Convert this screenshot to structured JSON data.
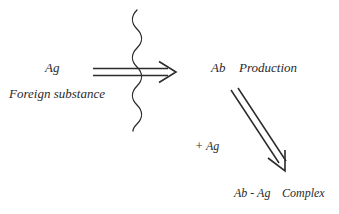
{
  "figure": {
    "type": "biology-process-diagram",
    "background_color": "#ffffff",
    "ink_color": "#2b2b2b",
    "width": 339,
    "height": 214
  },
  "labels": {
    "antigen": "Ag",
    "antigen_caption": "Foreign substance",
    "antibody": "Ab",
    "antibody_action": "Production",
    "plus_antigen": "+ Ag",
    "complex_pair": "Ab - Ag",
    "complex_word": "Complex"
  },
  "graphics": {
    "horizontal_arrow": {
      "name": "double-line-arrow-right",
      "x_start": 93,
      "x_end": 175,
      "y_top_line": 68,
      "y_bottom_line": 75,
      "arrowhead": "open-v"
    },
    "wavy_barrier": {
      "name": "vertical-wavy-line",
      "x_center": 137,
      "y_start": 10,
      "y_end": 131,
      "amplitude": 6,
      "period": 26
    },
    "diagonal_arrow": {
      "name": "double-line-arrow-down-right",
      "x_start": 231,
      "y_start": 90,
      "x_end": 286,
      "y_end": 171,
      "arrowhead": "open-v"
    }
  }
}
